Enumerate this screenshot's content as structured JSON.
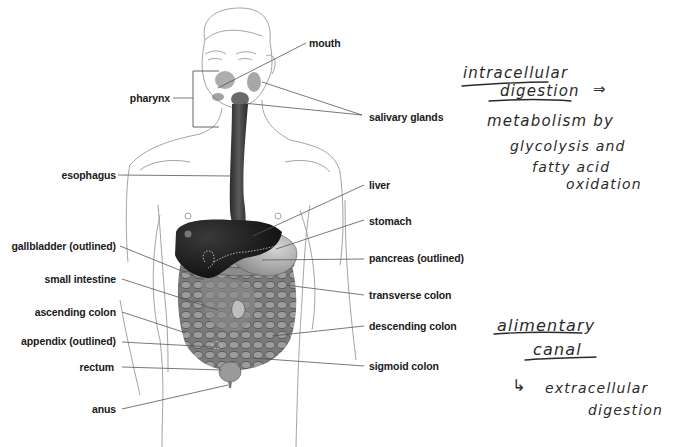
{
  "diagram": {
    "left_labels": [
      {
        "id": "pharynx",
        "text": "pharynx"
      },
      {
        "id": "esophagus",
        "text": "esophagus"
      },
      {
        "id": "gallbladder",
        "text": "gallbladder (outlined)"
      },
      {
        "id": "small_intestine",
        "text": "small intestine"
      },
      {
        "id": "ascending_colon",
        "text": "ascending colon"
      },
      {
        "id": "appendix",
        "text": "appendix (outlined)"
      },
      {
        "id": "rectum",
        "text": "rectum"
      },
      {
        "id": "anus",
        "text": "anus"
      }
    ],
    "right_labels": [
      {
        "id": "mouth",
        "text": "mouth"
      },
      {
        "id": "salivary_glands",
        "text": "salivary glands"
      },
      {
        "id": "liver",
        "text": "liver"
      },
      {
        "id": "stomach",
        "text": "stomach"
      },
      {
        "id": "pancreas",
        "text": "pancreas (outlined)"
      },
      {
        "id": "transverse_colon",
        "text": "transverse colon"
      },
      {
        "id": "descending_colon",
        "text": "descending colon"
      },
      {
        "id": "sigmoid_colon",
        "text": "sigmoid colon"
      }
    ]
  },
  "handwritten_notes": {
    "note1": {
      "heading_line1": "intracellular",
      "heading_line2": "digestion",
      "arrow": "⇒",
      "body_line1": "metabolism by",
      "body_line2": "glycolysis and",
      "body_line3": "fatty acid",
      "body_line4": "oxidation"
    },
    "note2": {
      "heading_line1": "alimentary",
      "heading_line2": "canal",
      "arrow": "↳",
      "body_line1": "extracellular",
      "body_line2": "digestion"
    }
  },
  "colors": {
    "outline": "#9a9a9a",
    "leader_line": "#555555",
    "organ_dark": "#1c1c1c",
    "organ_mid": "#6e6e6e",
    "organ_light": "#b5b5b5",
    "ink": "#2a2a2a"
  }
}
